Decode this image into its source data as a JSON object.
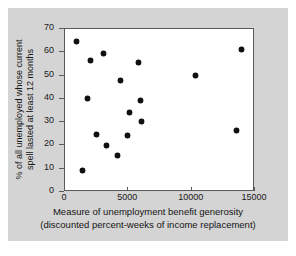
{
  "figure": {
    "panel_background": "#d4d4d4",
    "plot_background": "#ffffff",
    "frame_color": "#5a5a5a",
    "point_color": "#111111"
  },
  "chart_data": {
    "type": "scatter",
    "title": "",
    "subtitle": "",
    "xlabel_line1": "Measure of unemployment benefit generosity",
    "xlabel_line2": "(discounted percent-weeks of income replacement)",
    "ylabel_line1": "% of all unemployed whose current",
    "ylabel_line2": "spell lasted at least 12 months",
    "xlim": [
      0,
      15000
    ],
    "ylim": [
      0,
      70
    ],
    "xticks": [
      0,
      5000,
      10000,
      15000
    ],
    "yticks": [
      0,
      10,
      20,
      30,
      40,
      50,
      60,
      70
    ],
    "xtick_labels": [
      "0",
      "5000",
      "10000",
      "15000"
    ],
    "ytick_labels": [
      "0",
      "10",
      "20",
      "30",
      "40",
      "50",
      "60",
      "70"
    ],
    "grid": false,
    "legend": "none",
    "marker": "filled-diamond",
    "points": [
      {
        "x": 890,
        "y": 64.8
      },
      {
        "x": 1420,
        "y": 9.2
      },
      {
        "x": 1790,
        "y": 40.1
      },
      {
        "x": 2005,
        "y": 56.6
      },
      {
        "x": 2505,
        "y": 24.8
      },
      {
        "x": 3060,
        "y": 59.6
      },
      {
        "x": 3300,
        "y": 19.9
      },
      {
        "x": 4130,
        "y": 15.6
      },
      {
        "x": 4390,
        "y": 48.0
      },
      {
        "x": 4950,
        "y": 24.4
      },
      {
        "x": 5130,
        "y": 34.1
      },
      {
        "x": 5800,
        "y": 55.8
      },
      {
        "x": 5930,
        "y": 39.5
      },
      {
        "x": 6000,
        "y": 30.1
      },
      {
        "x": 10300,
        "y": 49.9
      },
      {
        "x": 13500,
        "y": 26.4
      },
      {
        "x": 13900,
        "y": 61.1
      }
    ]
  }
}
